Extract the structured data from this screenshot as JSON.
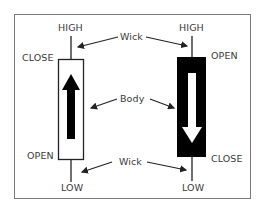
{
  "diagram": {
    "bullish_candle": {
      "labels": {
        "top": "HIGH",
        "body_top": "CLOSE",
        "body_bottom": "OPEN",
        "bottom": "LOW"
      },
      "body_color": "#ffffff",
      "arrow_direction": "up",
      "arrow_color": "#000000"
    },
    "bearish_candle": {
      "labels": {
        "top": "HIGH",
        "body_top": "OPEN",
        "body_bottom": "CLOSE",
        "bottom": "LOW"
      },
      "body_color": "#000000",
      "arrow_direction": "down",
      "arrow_color": "#ffffff"
    },
    "callouts": {
      "upper_wick": "Wick",
      "body": "Body",
      "lower_wick": "Wick"
    },
    "colors": {
      "frame": "#7a7a7a",
      "text": "#3a3a3a",
      "background": "#ffffff"
    }
  }
}
